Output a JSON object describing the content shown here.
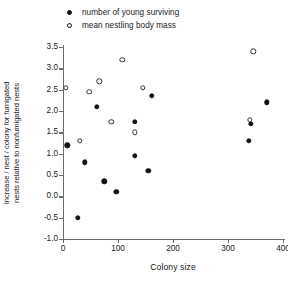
{
  "chart_data": {
    "type": "scatter",
    "title": "",
    "xlabel": "Colony size",
    "ylabel": "Increase / nest / colony for fumigated nests relative to nonfumigated nests",
    "ylabel_line1": "Increase / nest / colony for fumigated",
    "ylabel_line2": "nests relative to nonfumigated nests",
    "xlim": [
      0,
      400
    ],
    "ylim": [
      -1.0,
      3.5
    ],
    "xticks": [
      0,
      100,
      200,
      300,
      400
    ],
    "xtick_labels": [
      "0",
      "100",
      "200",
      "300",
      "400"
    ],
    "yticks": [
      -1.0,
      -0.5,
      0.0,
      0.5,
      1.0,
      1.5,
      2.0,
      2.5,
      3.0,
      3.5
    ],
    "ytick_labels": [
      "-1.0",
      "-0.5",
      "0.0",
      "0.5",
      "1.0",
      "1.5",
      "2.0",
      "2.5",
      "3.0",
      "3.5"
    ],
    "grid": false,
    "legend_position": "top-left",
    "series": [
      {
        "name": "number of young surviving",
        "marker": "filled-circle",
        "color": "#111111",
        "points": [
          {
            "x": 8,
            "y": 1.2
          },
          {
            "x": 27,
            "y": -0.5
          },
          {
            "x": 40,
            "y": 0.8
          },
          {
            "x": 62,
            "y": 2.1
          },
          {
            "x": 75,
            "y": 0.35
          },
          {
            "x": 97,
            "y": 0.1
          },
          {
            "x": 130,
            "y": 1.75
          },
          {
            "x": 130,
            "y": 0.95
          },
          {
            "x": 155,
            "y": 0.6
          },
          {
            "x": 162,
            "y": 2.35
          },
          {
            "x": 338,
            "y": 1.3
          },
          {
            "x": 341,
            "y": 1.7
          },
          {
            "x": 370,
            "y": 2.2
          }
        ]
      },
      {
        "name": "mean nestling body mass",
        "marker": "open-circle",
        "color": "#333333",
        "points": [
          {
            "x": 5,
            "y": 2.55
          },
          {
            "x": 30,
            "y": 1.3
          },
          {
            "x": 48,
            "y": 2.45
          },
          {
            "x": 66,
            "y": 2.7
          },
          {
            "x": 88,
            "y": 1.75
          },
          {
            "x": 108,
            "y": 3.2
          },
          {
            "x": 130,
            "y": 1.5
          },
          {
            "x": 145,
            "y": 2.55
          },
          {
            "x": 340,
            "y": 1.8
          },
          {
            "x": 346,
            "y": 3.4
          }
        ]
      }
    ]
  },
  "legend": {
    "items": [
      {
        "label": "number of young surviving",
        "marker": "filled"
      },
      {
        "label": "mean nestling body mass",
        "marker": "open"
      }
    ]
  }
}
